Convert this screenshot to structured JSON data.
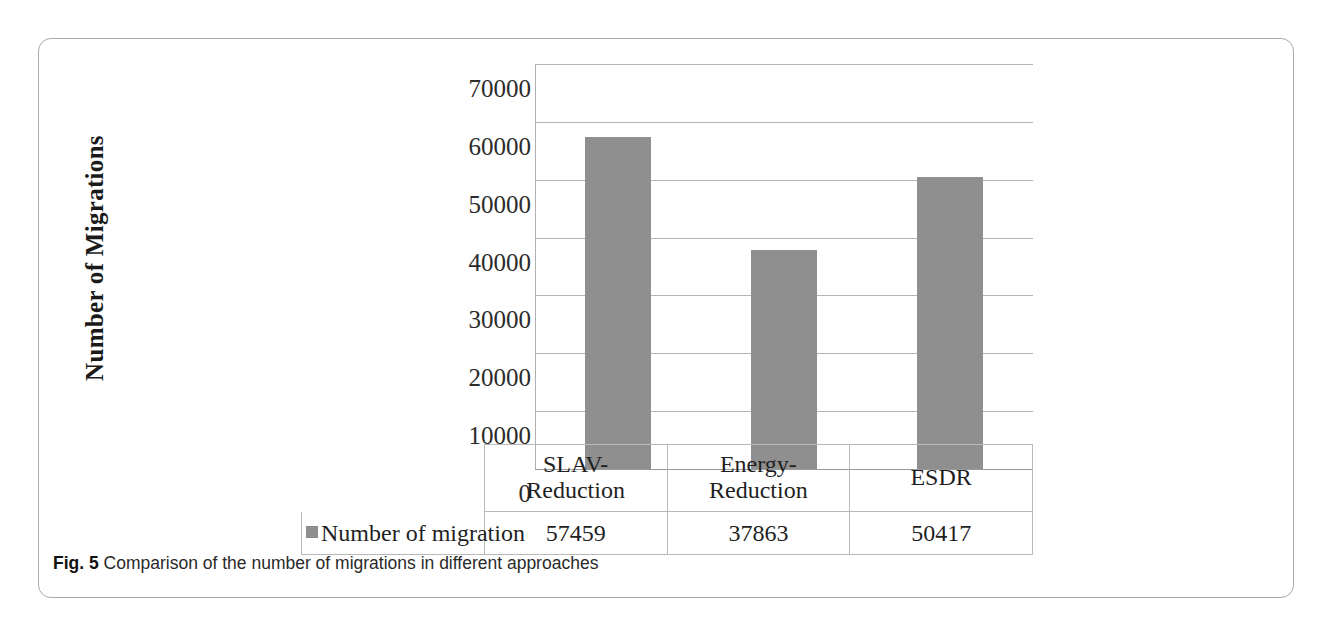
{
  "figure": {
    "caption_label": "Fig. 5",
    "caption_text": " Comparison of the number of migrations in different approaches"
  },
  "chart_data": {
    "type": "bar",
    "title": "",
    "xlabel": "",
    "ylabel": "Number of Migrations",
    "categories": [
      "SLAV-Reduction",
      "Energy-Reduction",
      "ESDR"
    ],
    "category_lines": [
      [
        "SLAV-",
        "Reduction"
      ],
      [
        "Energy-",
        "Reduction"
      ],
      [
        "ESDR",
        ""
      ]
    ],
    "series": [
      {
        "name": "Number of migration",
        "values": [
          57459,
          37863,
          50417
        ]
      }
    ],
    "values": [
      57459,
      37863,
      50417
    ],
    "ylim": [
      0,
      70000
    ],
    "ytick_labels": [
      "70000",
      "60000",
      "50000",
      "40000",
      "30000",
      "20000",
      "10000",
      "0"
    ],
    "ytick_values": [
      70000,
      60000,
      50000,
      40000,
      30000,
      20000,
      10000,
      0
    ],
    "grid": true,
    "legend_position": "table-row",
    "bar_color": "#8f8f8f",
    "gridline_color": "#b4b4b4"
  },
  "table": {
    "legend_label": "Number of migration",
    "value_cells": [
      "57459",
      "37863",
      "50417"
    ]
  }
}
